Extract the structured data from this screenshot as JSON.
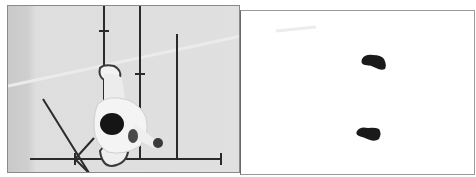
{
  "figure": {
    "panels": [
      {
        "id": "photo-panel",
        "description": "Top-down photograph of a person standing on a floor marked with measurement lines",
        "background_color": "#dedede",
        "line_color": "#2a2a2a",
        "subject": "person viewed from above, dark hair, white clothing",
        "lines": [
          {
            "type": "vertical",
            "x": 96,
            "y1": 0,
            "y2": 153
          },
          {
            "type": "vertical",
            "x": 132,
            "y1": 0,
            "y2": 153
          },
          {
            "type": "vertical",
            "x": 169,
            "y1": 28,
            "y2": 153
          },
          {
            "type": "horizontal",
            "y": 153,
            "x1": 22,
            "x2": 213
          },
          {
            "type": "diagonal",
            "x1": 35,
            "y1": 93,
            "x2": 81,
            "y2": 167
          },
          {
            "type": "diagonal",
            "x1": 86,
            "y1": 132,
            "x2": 67,
            "y2": 153
          }
        ]
      },
      {
        "id": "footprint-panel",
        "description": "White panel showing two dark footprint shapes",
        "background_color": "#ffffff",
        "footprint_color": "#1a1a1a",
        "footprints": [
          {
            "name": "upper-footprint",
            "cx": 131,
            "cy": 52
          },
          {
            "name": "lower-footprint",
            "cx": 125,
            "cy": 121
          }
        ]
      }
    ]
  }
}
